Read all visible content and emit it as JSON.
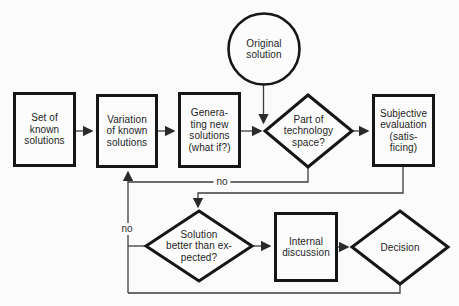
{
  "diagram": {
    "colors": {
      "background": "#fbfbfb",
      "ink": "#242424",
      "shape_border": "#161616",
      "connector": "#3d3d3d"
    },
    "nodes": {
      "original_solution": {
        "shape": "circle",
        "label": "Original\nsolution"
      },
      "set_of_known_solutions": {
        "shape": "rect",
        "label": "Set of\nknown\nsolutions"
      },
      "variation_of_known_solutions": {
        "shape": "rect",
        "label": "Variation\nof known\nsolutions"
      },
      "generating_new_solutions": {
        "shape": "rect",
        "label": "Genera-\nting new\nsolutions\n(what if?)"
      },
      "part_of_technology_space": {
        "shape": "diamond",
        "label": "Part of\ntechnology\nspace?"
      },
      "subjective_evaluation": {
        "shape": "rect",
        "label": "Subjective\nevaluation\n(satis-\nficing)"
      },
      "solution_better_than_expected": {
        "shape": "diamond",
        "label": "Solution\nbetter than ex-\npected?"
      },
      "internal_discussion": {
        "shape": "rect",
        "label": "Internal\ndiscussion"
      },
      "decision": {
        "shape": "diamond",
        "label": "Decision"
      }
    },
    "edge_labels": {
      "no_top": "no",
      "no_left": "no"
    }
  }
}
